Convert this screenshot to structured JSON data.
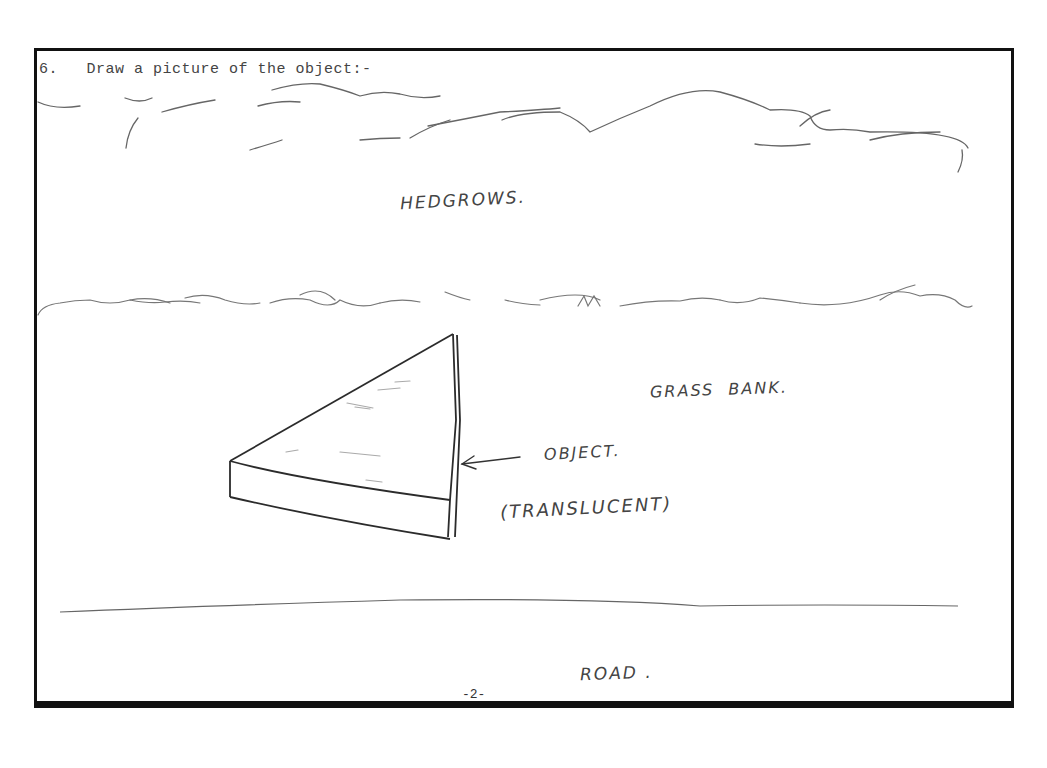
{
  "question": {
    "number": "6.",
    "prompt": "Draw a picture of the object:-"
  },
  "labels": {
    "hedgerows": "HEDGROWS.",
    "grass_bank": "GRASS  BANK.",
    "object": "OBJECT.",
    "translucent": "(TRANSLUCENT)",
    "road": "ROAD ."
  },
  "page_number": "-2-",
  "colors": {
    "ink": "#111111",
    "pencil": "#555555",
    "paper": "#ffffff"
  }
}
